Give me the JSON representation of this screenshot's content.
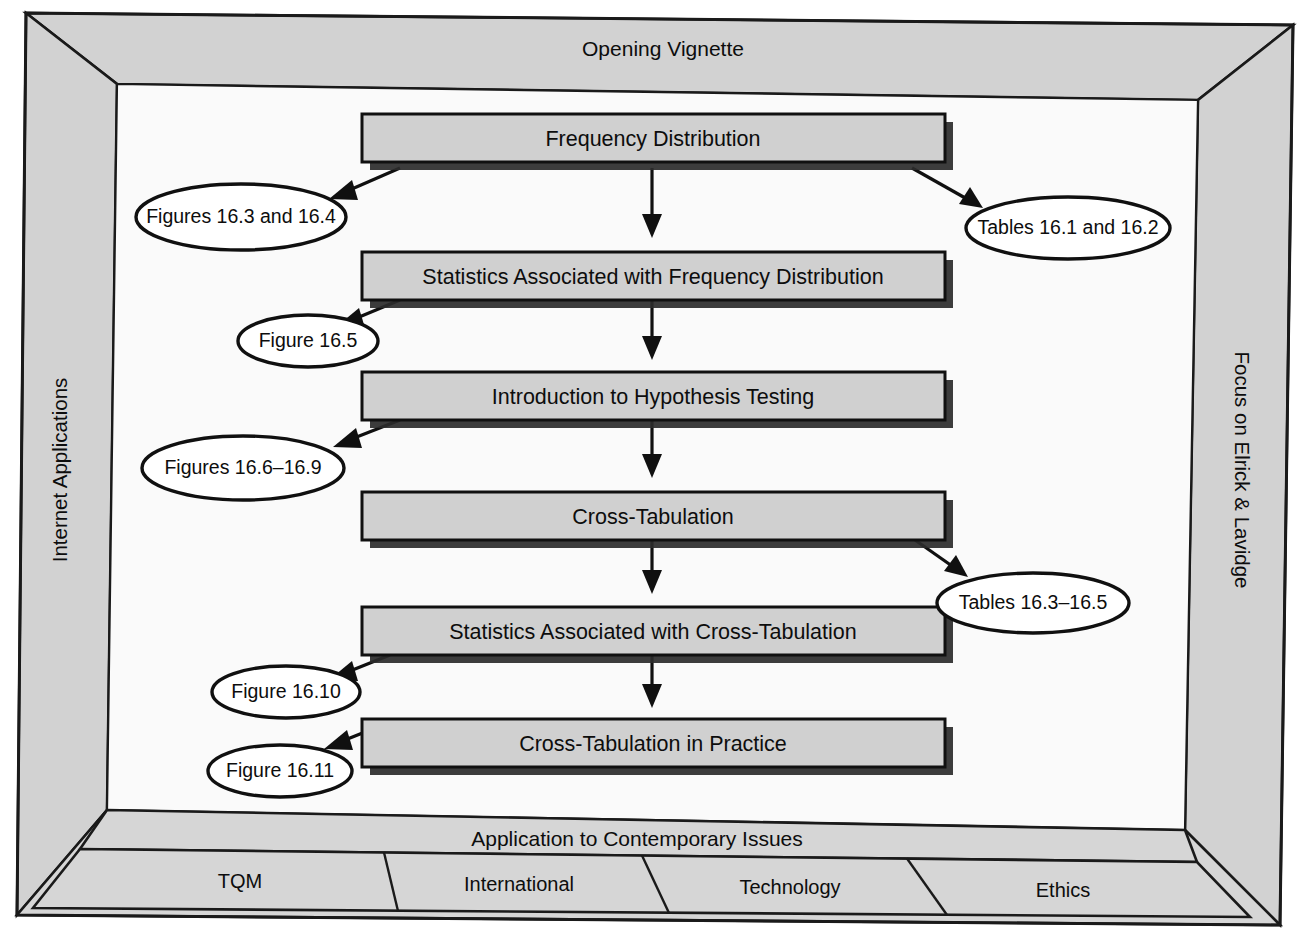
{
  "diagram": {
    "title": "Opening Vignette",
    "type": "chapter-overview-flowchart",
    "frame": {
      "top_label": "Opening Vignette",
      "left_label": "Internet Applications",
      "right_label": "Focus on Elrick & Lavidge",
      "bottom_band_label": "Application to Contemporary Issues",
      "bottom_cells": [
        "TQM",
        "International",
        "Technology",
        "Ethics"
      ]
    },
    "process_steps": [
      {
        "id": "step1",
        "label": "Frequency Distribution"
      },
      {
        "id": "step2",
        "label": "Statistics Associated with Frequency Distribution"
      },
      {
        "id": "step3",
        "label": "Introduction to Hypothesis Testing"
      },
      {
        "id": "step4",
        "label": "Cross-Tabulation"
      },
      {
        "id": "step5",
        "label": "Statistics Associated with Cross-Tabulation"
      },
      {
        "id": "step6",
        "label": "Cross-Tabulation in Practice"
      }
    ],
    "references": [
      {
        "id": "ref1",
        "label": "Figures 16.3 and 16.4",
        "side": "left",
        "from": "step1"
      },
      {
        "id": "ref2",
        "label": "Tables 16.1 and 16.2",
        "side": "right",
        "from": "step1"
      },
      {
        "id": "ref3",
        "label": "Figure 16.5",
        "side": "left",
        "from": "step2"
      },
      {
        "id": "ref4",
        "label": "Figures 16.6–16.9",
        "side": "left",
        "from": "step3"
      },
      {
        "id": "ref5",
        "label": "Tables 16.3–16.5",
        "side": "right",
        "from": "step4"
      },
      {
        "id": "ref6",
        "label": "Figure 16.10",
        "side": "left",
        "from": "step5"
      },
      {
        "id": "ref7",
        "label": "Figure 16.11",
        "side": "left",
        "from": "step6"
      }
    ],
    "flow_sequence": [
      "Frequency Distribution",
      "Statistics Associated with Frequency Distribution",
      "Introduction to Hypothesis Testing",
      "Cross-Tabulation",
      "Statistics Associated with Cross-Tabulation",
      "Cross-Tabulation in Practice"
    ],
    "colors": {
      "frame_fill": "#d2d2d2",
      "box_fill": "#d0d0d0",
      "panel_fill": "#fafafa",
      "line": "#101010",
      "ellipse_fill": "#ffffff"
    }
  }
}
